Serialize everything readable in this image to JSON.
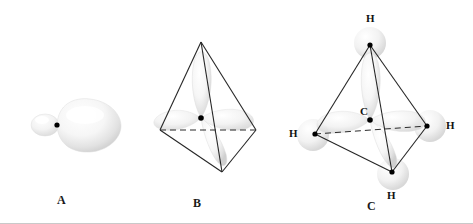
{
  "figure": {
    "width": 473,
    "height": 224,
    "background_color": "#ffffff",
    "line_color": "#262626",
    "nucleus_color": "#000000",
    "lobe_color": "#e8e8e8",
    "bottom_rule_color": "#c9c9c9"
  },
  "panels": [
    {
      "id": "A",
      "label": "A",
      "label_x": 57,
      "label_y": 200,
      "description": "single sp3 hybrid orbital with small back lobe and large front lobe",
      "nucleus": {
        "x": 57,
        "y": 125
      }
    },
    {
      "id": "B",
      "label": "B",
      "label_x": 193,
      "label_y": 203,
      "description": "four sp3 hybrid orbitals directed to the corners of a tetrahedron",
      "nucleus": {
        "x": 201,
        "y": 118
      },
      "vertices": [
        {
          "name": "top",
          "x": 201,
          "y": 42
        },
        {
          "name": "left",
          "x": 160,
          "y": 130
        },
        {
          "name": "right",
          "x": 256,
          "y": 130
        },
        {
          "name": "bottom-front",
          "x": 222,
          "y": 172
        }
      ]
    },
    {
      "id": "C",
      "label": "C",
      "label_x": 367,
      "label_y": 206,
      "description": "methane molecule, four C-H sigma bonds in a tetrahedron",
      "center_atom": {
        "symbol": "C",
        "label_x": 360,
        "label_y": 112,
        "x": 370,
        "y": 120
      },
      "hydrogens": [
        {
          "symbol": "H",
          "label_x": 366,
          "label_y": 13,
          "x": 370,
          "y": 45,
          "position": "top"
        },
        {
          "symbol": "H",
          "label_x": 289,
          "label_y": 128,
          "x": 315,
          "y": 134,
          "position": "left"
        },
        {
          "symbol": "H",
          "label_x": 446,
          "label_y": 120,
          "x": 427,
          "y": 126,
          "position": "right"
        },
        {
          "symbol": "H",
          "label_x": 387,
          "label_y": 190,
          "x": 392,
          "y": 172,
          "position": "bottom-front"
        }
      ]
    }
  ]
}
